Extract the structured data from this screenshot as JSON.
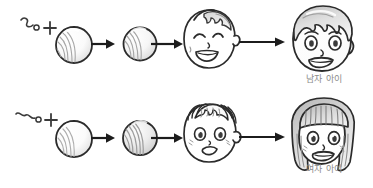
{
  "figure": {
    "background_color": "#ffffff",
    "ink_color": "#2b2b2b",
    "caption_color": "#8c8c8c",
    "shade_color": "#c9c9c9"
  },
  "rows": [
    {
      "id": "boy",
      "caption": "남자 아이",
      "stages": [
        {
          "id": "fertilization",
          "icon": "sperm-plus-egg-icon",
          "plus_symbol": "+"
        },
        {
          "id": "zygote",
          "icon": "zygote-cell-icon"
        },
        {
          "id": "baby",
          "icon": "baby-boy-face-icon"
        },
        {
          "id": "child",
          "icon": "boy-face-icon"
        }
      ],
      "arrows": [
        {
          "id": "arrow-1",
          "symbol": "→",
          "length": "short"
        },
        {
          "id": "arrow-2",
          "symbol": "→",
          "length": "medium"
        },
        {
          "id": "arrow-3",
          "symbol": "→",
          "length": "long"
        }
      ]
    },
    {
      "id": "girl",
      "caption": "여자 아이",
      "stages": [
        {
          "id": "fertilization",
          "icon": "sperm-plus-egg-icon",
          "plus_symbol": "+"
        },
        {
          "id": "zygote",
          "icon": "zygote-cell-icon"
        },
        {
          "id": "baby",
          "icon": "baby-girl-face-icon"
        },
        {
          "id": "child",
          "icon": "girl-face-icon"
        }
      ],
      "arrows": [
        {
          "id": "arrow-1",
          "symbol": "→",
          "length": "short"
        },
        {
          "id": "arrow-2",
          "symbol": "→",
          "length": "medium"
        },
        {
          "id": "arrow-3",
          "symbol": "→",
          "length": "long"
        }
      ]
    }
  ]
}
